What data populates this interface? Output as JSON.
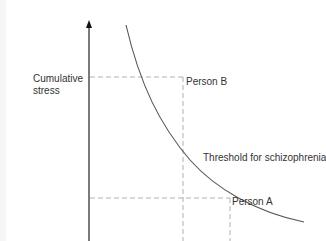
{
  "diagram": {
    "y_axis_label": "Cumulative stress",
    "curve_label": "Threshold for schizophrenia",
    "points": [
      {
        "label": "Person B",
        "x": 183,
        "y": 77
      },
      {
        "label": "Person A",
        "x": 230,
        "y": 198
      }
    ],
    "colors": {
      "axis": "#222222",
      "curve": "#555555",
      "dashed": "#b0b0b0",
      "text": "#333333"
    }
  }
}
